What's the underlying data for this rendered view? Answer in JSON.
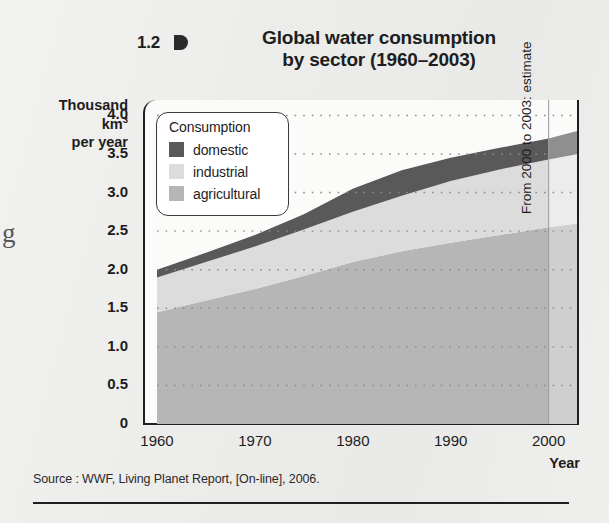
{
  "figure": {
    "number": "1.2",
    "title_line1": "Global water consumption",
    "title_line2": "by sector (1960–2003)",
    "margin_glyph": "g"
  },
  "axes": {
    "y_caption_line1": "Thousand",
    "y_caption_line2_pre": "km",
    "y_caption_line2_sup": "3",
    "y_caption_line3": "per year",
    "x_title": "Year"
  },
  "legend": {
    "title": "Consumption",
    "items": [
      {
        "label": "domestic",
        "color": "#595959"
      },
      {
        "label": "industrial",
        "color": "#dcdcdc"
      },
      {
        "label": "agricultural",
        "color": "#b6b6b6"
      }
    ]
  },
  "annotation": {
    "estimate_note": "From 2000 to 2003: estimate"
  },
  "source": {
    "text": "Source : WWF, Living Planet Report, [On-line], 2006."
  },
  "colors": {
    "domestic": "#595959",
    "industrial": "#dcdcdc",
    "agricultural": "#b6b6b6",
    "domestic_estimate": "#8f8f8f",
    "industrial_estimate": "#ececec",
    "agricultural_estimate": "#cfcfcf",
    "axis": "#1f1f1f",
    "gridline": "#8c8c8c",
    "plot_background": "#fbfbfa"
  },
  "chart_data": {
    "type": "area",
    "title": "Global water consumption by sector (1960–2003)",
    "xlabel": "Year",
    "ylabel": "Thousand km³ per year",
    "stacked": true,
    "grid": true,
    "legend_position": "top-left",
    "xlim": [
      1960,
      2003
    ],
    "ylim": [
      0,
      4.2
    ],
    "xticks": [
      1960,
      1970,
      1980,
      1990,
      2000
    ],
    "xtick_labels": [
      "1960",
      "1970",
      "1980",
      "1990",
      "2000"
    ],
    "yticks": [
      0,
      0.5,
      1.0,
      1.5,
      2.0,
      2.5,
      3.0,
      3.5,
      4.0
    ],
    "ytick_labels": [
      "0",
      "0.5",
      "1.0",
      "1.5",
      "2.0",
      "2.5",
      "3.0",
      "3.5",
      "4.0"
    ],
    "x": [
      1960,
      1965,
      1970,
      1975,
      1980,
      1985,
      1990,
      1995,
      2000,
      2003
    ],
    "series": [
      {
        "name": "agricultural",
        "color": "#b6b6b6",
        "values": [
          1.45,
          1.6,
          1.75,
          1.92,
          2.1,
          2.24,
          2.35,
          2.45,
          2.55,
          2.6
        ]
      },
      {
        "name": "industrial",
        "color": "#dcdcdc",
        "values": [
          0.45,
          0.5,
          0.55,
          0.6,
          0.65,
          0.72,
          0.8,
          0.85,
          0.88,
          0.9
        ]
      },
      {
        "name": "domestic",
        "color": "#595959",
        "values": [
          0.1,
          0.12,
          0.15,
          0.2,
          0.3,
          0.33,
          0.3,
          0.28,
          0.27,
          0.3
        ]
      }
    ],
    "totals": [
      2.0,
      2.22,
      2.45,
      2.72,
      3.05,
      3.29,
      3.45,
      3.58,
      3.7,
      3.8
    ],
    "estimate_from": 2000,
    "estimate_to": 2003,
    "annotations": [
      {
        "text": "From 2000 to 2003: estimate",
        "orientation": "vertical",
        "at_x": 2001
      }
    ]
  }
}
